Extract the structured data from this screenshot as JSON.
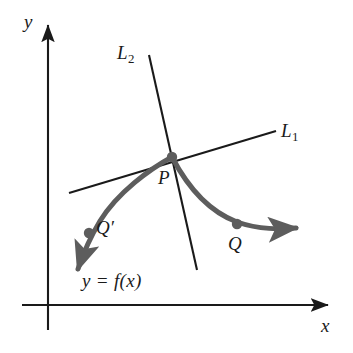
{
  "figure": {
    "kind": "secant-and-tangent-line-diagram",
    "background_color": "#ffffff"
  },
  "axes": {
    "color": "#1a1a1a",
    "origin": {
      "x": 48,
      "y": 305
    },
    "x_axis": {
      "label": "x",
      "from": {
        "x": 22,
        "y": 305
      },
      "to": {
        "x": 332,
        "y": 305
      },
      "arrow": "right"
    },
    "y_axis": {
      "label": "y",
      "from": {
        "x": 48,
        "y": 330
      },
      "to": {
        "x": 48,
        "y": 20
      },
      "arrow": "up"
    }
  },
  "curve": {
    "label": "y = f(x)",
    "color": "#5d5d5d",
    "stroke_width": 5,
    "arrows": [
      "left-end",
      "right-end"
    ],
    "left_arrow_tip": {
      "x": 72,
      "y": 277
    },
    "right_arrow_tip": {
      "x": 302,
      "y": 228
    }
  },
  "lines": [
    {
      "name": "L1",
      "label": "L",
      "subscript": "1",
      "role": "tangent-line",
      "color": "#1a1a1a",
      "stroke_width": 2,
      "from": {
        "x": 69,
        "y": 193
      },
      "to": {
        "x": 276,
        "y": 131
      }
    },
    {
      "name": "L2",
      "label": "L",
      "subscript": "2",
      "role": "normal-line",
      "color": "#1a1a1a",
      "stroke_width": 2,
      "from": {
        "x": 149,
        "y": 55
      },
      "to": {
        "x": 197,
        "y": 270
      }
    }
  ],
  "points": [
    {
      "name": "P",
      "label": "P",
      "prime": "",
      "x": 172,
      "y": 157,
      "radius": 5,
      "color": "#5d5d5d"
    },
    {
      "name": "Q",
      "label": "Q",
      "prime": "",
      "x": 237,
      "y": 225,
      "radius": 5,
      "color": "#5d5d5d"
    },
    {
      "name": "Qprime",
      "label": "Q",
      "prime": "′",
      "x": 88,
      "y": 233,
      "radius": 5,
      "color": "#5d5d5d"
    }
  ],
  "labels": {
    "y_axis": "y",
    "x_axis": "x",
    "line_1_base": "L",
    "line_1_sub": "1",
    "line_2_base": "L",
    "line_2_sub": "2",
    "point_p": "P",
    "point_q": "Q",
    "point_q_prime": "Q′",
    "function": "y = f(x)"
  }
}
